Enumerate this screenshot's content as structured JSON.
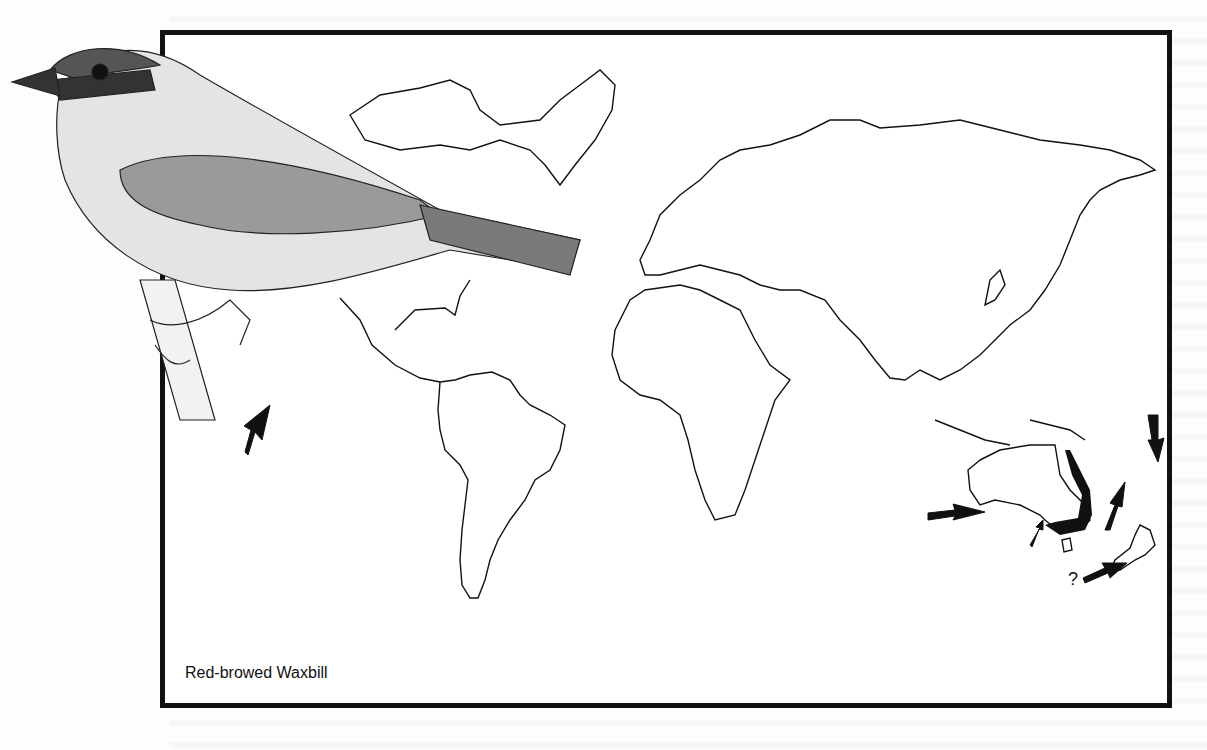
{
  "figure": {
    "caption": "Red-browed Waxbill",
    "map_type": "world distribution map (introduced range)",
    "native_range": "eastern Australia (shaded coastal band)",
    "introduction_markers": [
      {
        "label": "arrow",
        "location": "South Atlantic (island, west of South America)"
      },
      {
        "label": "arrow",
        "location": "Western Australia (Perth)"
      },
      {
        "label": "arrow",
        "location": "South Australia (Adelaide area)"
      },
      {
        "label": "arrow",
        "location": "New Caledonia / Pacific island"
      },
      {
        "label": "arrow",
        "location": "Pacific island (Tahiti region)"
      },
      {
        "label": "arrow",
        "location": "New Zealand"
      }
    ],
    "uncertain_marker": "?",
    "illustration": "Red-browed Waxbill perched on a stem"
  }
}
